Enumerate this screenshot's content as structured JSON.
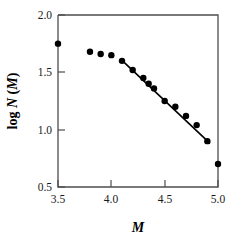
{
  "chart_data": {
    "type": "scatter",
    "title": "",
    "subtitle": "",
    "xlabel": "M",
    "ylabel": "log N(M)",
    "ylabel_parts": {
      "prefix": "log ",
      "symbol_n": "N",
      "open_paren": " (",
      "symbol_m": "M",
      "close_paren": ")"
    },
    "xlim": [
      3.5,
      5.0
    ],
    "ylim": [
      0.5,
      2.0
    ],
    "xticks": [
      3.5,
      4.0,
      4.5,
      5.0
    ],
    "xtick_labels": [
      "3.5",
      "4.0",
      "4.5",
      "5.0"
    ],
    "yticks": [
      0.5,
      1.0,
      1.5,
      2.0
    ],
    "ytick_labels": [
      "0.5",
      "1.0",
      "1.5",
      "2.0"
    ],
    "grid": false,
    "legend": false,
    "legend_position": "none",
    "marker": "filled-circle",
    "marker_color": "#000000",
    "line_color": "#000000",
    "frame_color": "#4d4d4d",
    "x": [
      3.5,
      3.8,
      3.9,
      4.0,
      4.1,
      4.2,
      4.3,
      4.35,
      4.4,
      4.5,
      4.6,
      4.7,
      4.8,
      4.9,
      5.0
    ],
    "y": [
      1.75,
      1.68,
      1.66,
      1.65,
      1.6,
      1.52,
      1.45,
      1.4,
      1.36,
      1.25,
      1.2,
      1.12,
      1.04,
      0.9,
      0.7
    ],
    "series": [
      {
        "name": "log N(M)",
        "x": [
          3.5,
          3.8,
          3.9,
          4.0,
          4.1,
          4.2,
          4.3,
          4.35,
          4.4,
          4.5,
          4.6,
          4.7,
          4.8,
          4.9,
          5.0
        ],
        "values": [
          1.75,
          1.68,
          1.66,
          1.65,
          1.6,
          1.52,
          1.45,
          1.4,
          1.36,
          1.25,
          1.2,
          1.12,
          1.04,
          0.9,
          0.7
        ]
      }
    ],
    "fit_line": {
      "name": "linear fit",
      "x_start": 4.1,
      "y_start": 1.605,
      "x_end": 4.92,
      "y_end": 0.885,
      "slope": -0.878
    },
    "annotations": []
  }
}
